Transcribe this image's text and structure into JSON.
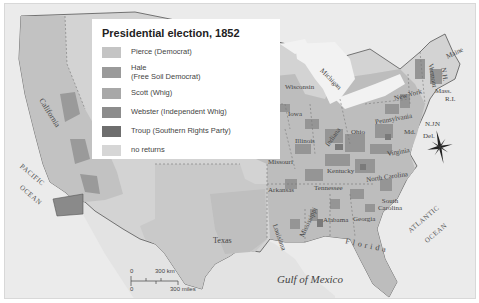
{
  "map": {
    "title": "Presidential election, 1852",
    "legend": [
      {
        "label": "Pierce (Democrat)",
        "color": "#c4c4c4"
      },
      {
        "label": "Hale\n(Free Soil Democrat)",
        "label_line1": "Hale",
        "label_line2": "(Free Soil Democrat)",
        "color": "#9a9a9a"
      },
      {
        "label": "Scott (Whig)",
        "color": "#a8a8a8"
      },
      {
        "label": "Webster (Independent Whig)",
        "color": "#8c8c8c"
      },
      {
        "label": "Troup (Southern Rights Party)",
        "color": "#6e6e6e"
      },
      {
        "label": "no returns",
        "color": "#d6d6d6"
      }
    ],
    "state_labels": [
      "California",
      "Texas",
      "Iowa",
      "Wisconsin",
      "Michigan",
      "Illinois",
      "Indiana",
      "Ohio",
      "Missouri",
      "Kentucky",
      "Arkansas",
      "Tennessee",
      "Louisiana",
      "Mississippi",
      "Alabama",
      "Georgia",
      "Florida",
      "South Carolina",
      "North Carolina",
      "Virginia",
      "Pennsylvania",
      "New York",
      "Maine",
      "Vermont",
      "N.H.",
      "Mass.",
      "R.I.",
      "Md.",
      "N.J.",
      "Del."
    ],
    "water_labels": {
      "pacific_1": "PACIFIC",
      "pacific_2": "OCEAN",
      "atlantic_1": "ATLANTIC",
      "atlantic_2": "OCEAN",
      "gulf": "Gulf of Mexico"
    },
    "scale": {
      "km_zero": "0",
      "km_label": "300 km",
      "mi_zero": "0",
      "mi_label": "300 miles"
    },
    "compass": {
      "north_label": "N"
    }
  }
}
